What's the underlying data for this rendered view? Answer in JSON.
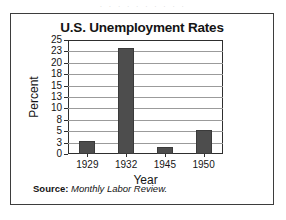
{
  "scan": {
    "artifact_text": "· · · · · · · · · ·"
  },
  "figure": {
    "title": "U.S. Unemployment Rates",
    "source_label": "Source:",
    "source_value": "Monthly Labor Review.",
    "bar_color": "#4d4d4d",
    "grid_color": "#9b9b9b",
    "axis_color": "#2e2e2e"
  },
  "chart_data": {
    "type": "bar",
    "title": "U.S. Unemployment Rates",
    "xlabel": "Year",
    "ylabel": "Percent",
    "categories": [
      "1929",
      "1932",
      "1945",
      "1950"
    ],
    "values": [
      3.2,
      23.6,
      1.9,
      5.3
    ],
    "series": [
      {
        "name": "U.S. Unemployment Rate",
        "values": [
          3.2,
          23.6,
          1.9,
          5.3
        ]
      }
    ],
    "ytick_labels": [
      "0",
      "3",
      "5",
      "8",
      "10",
      "13",
      "15",
      "18",
      "20",
      "23",
      "25"
    ],
    "ytick_values": [
      0,
      3,
      5,
      8,
      10,
      13,
      15,
      18,
      20,
      23,
      25
    ],
    "ylim": [
      0,
      25
    ],
    "grid": true,
    "grid_axis": "y",
    "legend": false,
    "legend_position": "none",
    "note": "Y tick labels are evenly spaced on the axis although their numeric steps alternate 3/2."
  }
}
